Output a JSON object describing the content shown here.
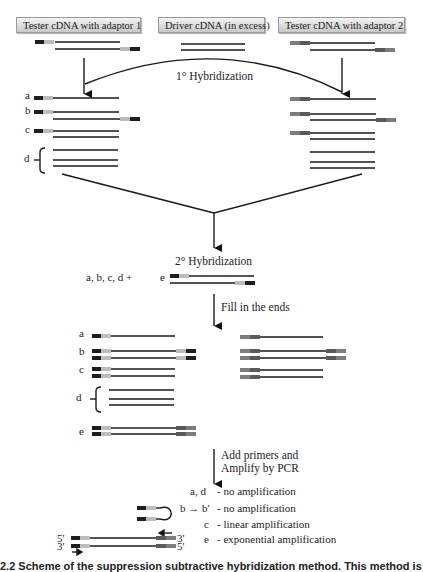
{
  "headers": {
    "tester1": "Tester cDNA with adaptor 1",
    "driver": "Driver cDNA (in excess)",
    "tester2": "Tester cDNA with adaptor 2"
  },
  "steps": {
    "hyb1": "1° Hybridization",
    "hyb2": "2° Hybridization",
    "fill": "Fill in the ends",
    "pcr_line1": "Add primers and",
    "pcr_line2": "Amplify by PCR"
  },
  "molecule_labels": {
    "a": "a",
    "b": "b",
    "c": "c",
    "d": "d",
    "e": "e",
    "combo": "a, b, c, d +"
  },
  "results": [
    {
      "key": "a, d",
      "text": "- no amplification"
    },
    {
      "key": "b → b'",
      "text": "- no amplification"
    },
    {
      "key": "c",
      "text": "- linear amplification"
    },
    {
      "key": "e",
      "text": "- exponential amplification"
    }
  ],
  "ends": {
    "top_left": "5'",
    "top_right": "3'",
    "bottom_left": "3'",
    "bottom_right": "5'"
  },
  "caption": "2.2  Scheme of the suppression subtractive hybridization method. This method is",
  "colors": {
    "strand": "#1a1a1a",
    "adaptor1_dark": "#1e1e1e",
    "adaptor1_light": "#bdbdbd",
    "adaptor2_dark": "#5a5a5a",
    "adaptor2_light": "#7c7c7c"
  }
}
